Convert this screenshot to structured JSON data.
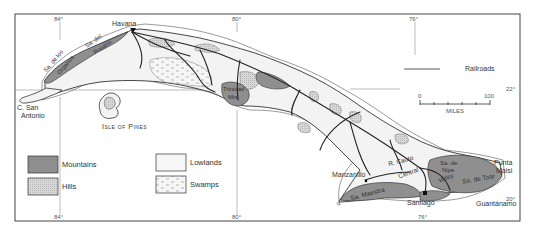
{
  "map": {
    "region": "Cuba",
    "colors": {
      "mountains": "#8f8f8f",
      "hills": "#d0d0d0",
      "lowlands": "#f3f3f3",
      "swamps": "#f3f3f3",
      "outline": "#333333",
      "frame": "#444444"
    },
    "graticule": {
      "lon_top": [
        "84°",
        "80°",
        "76°"
      ],
      "lon_bottom": [
        "84°",
        "80°",
        "76°"
      ],
      "lat_right": [
        "22°",
        "20°"
      ]
    },
    "places": {
      "havana": "Havana",
      "cape": [
        "C. San",
        "Antonio"
      ],
      "isle": "Isle of Pines",
      "manzanillo": "Manzanillo",
      "santiago": "Santiago",
      "guantanamo": "Guantánamo",
      "punta": [
        "Punta",
        "Maisi"
      ]
    },
    "physical_labels": {
      "organos": [
        "Sa. de los",
        "Organos"
      ],
      "rosario": [
        "Sa. del",
        "Rosario"
      ],
      "trinidad": [
        "Trinidad",
        "Mts."
      ],
      "cauto": "R. Cauto",
      "central": "Central",
      "nipe": [
        "Sa. de",
        "Nipe"
      ],
      "valley": "Valley",
      "maestra": "Sa. Maestra",
      "toar": "Sa. de Toar"
    },
    "railroads_label": "Railroads",
    "scale": {
      "start": "0",
      "end": "100",
      "unit": "MILES"
    },
    "legend": [
      {
        "key": "mountains",
        "label": "Mountains"
      },
      {
        "key": "hills",
        "label": "Hills"
      },
      {
        "key": "lowlands",
        "label": "Lowlands"
      },
      {
        "key": "swamps",
        "label": "Swamps"
      }
    ]
  }
}
